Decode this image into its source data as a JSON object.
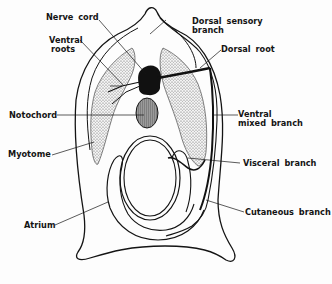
{
  "diagram": {
    "colors": {
      "ink": "#141414",
      "stipple": "#c9c9c9",
      "notochord": "#8a8a8a",
      "background": "#fdfdfd"
    },
    "labels": {
      "nerve_cord": "Nerve cord",
      "ventral_roots_1": "Ventral",
      "ventral_roots_2": "roots",
      "dorsal_sensory_1": "Dorsal sensory",
      "dorsal_sensory_2": "branch",
      "dorsal_root": "Dorsal root",
      "notochord": "Notochord",
      "ventral_mixed_1": "Ventral",
      "ventral_mixed_2": "mixed branch",
      "myotome": "Myotome",
      "visceral_branch": "Visceral branch",
      "atrium": "Atrium",
      "cutaneous_branch": "Cutaneous branch"
    }
  }
}
